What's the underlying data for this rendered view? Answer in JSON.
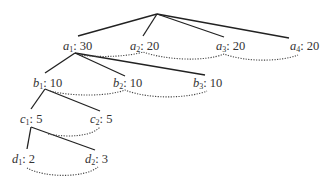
{
  "diagram": {
    "type": "tree",
    "root": {
      "x": 157,
      "y": 14
    },
    "nodes": [
      {
        "id": "a1",
        "letter": "a",
        "index": "1",
        "value": "30",
        "x": 63,
        "y": 40
      },
      {
        "id": "a2",
        "letter": "a",
        "index": "2",
        "value": "20",
        "x": 130,
        "y": 40
      },
      {
        "id": "a3",
        "letter": "a",
        "index": "3",
        "value": "20",
        "x": 216,
        "y": 40
      },
      {
        "id": "a4",
        "letter": "a",
        "index": "4",
        "value": "20",
        "x": 290,
        "y": 40
      },
      {
        "id": "b1",
        "letter": "b",
        "index": "1",
        "value": "10",
        "x": 33,
        "y": 77
      },
      {
        "id": "b2",
        "letter": "b",
        "index": "2",
        "value": "10",
        "x": 113,
        "y": 77
      },
      {
        "id": "b3",
        "letter": "b",
        "index": "3",
        "value": "10",
        "x": 193,
        "y": 77
      },
      {
        "id": "c1",
        "letter": "c",
        "index": "1",
        "value": "5",
        "x": 20,
        "y": 113
      },
      {
        "id": "c2",
        "letter": "c",
        "index": "2",
        "value": "5",
        "x": 90,
        "y": 113
      },
      {
        "id": "d1",
        "letter": "d",
        "index": "1",
        "value": "2",
        "x": 12,
        "y": 153
      },
      {
        "id": "d2",
        "letter": "d",
        "index": "2",
        "value": "3",
        "x": 85,
        "y": 153
      }
    ],
    "labels": {
      "a1": "a",
      "a1_sub": "1",
      "a1_val": ": 30",
      "a2": "a",
      "a2_sub": "2",
      "a2_val": ": 20",
      "a3": "a",
      "a3_sub": "3",
      "a3_val": ": 20",
      "a4": "a",
      "a4_sub": "4",
      "a4_val": ": 20",
      "b1": "b",
      "b1_sub": "1",
      "b1_val": ": 10",
      "b2": "b",
      "b2_sub": "2",
      "b2_val": ": 10",
      "b3": "b",
      "b3_sub": "3",
      "b3_val": ": 10",
      "c1": "c",
      "c1_sub": "1",
      "c1_val": ": 5",
      "c2": "c",
      "c2_sub": "2",
      "c2_val": ": 5",
      "d1": "d",
      "d1_sub": "1",
      "d1_val": ": 2",
      "d2": "d",
      "d2_sub": "2",
      "d2_val": ": 3"
    },
    "edges": [
      [
        "root",
        "a1"
      ],
      [
        "root",
        "a2"
      ],
      [
        "root",
        "a3"
      ],
      [
        "root",
        "a4"
      ],
      [
        "a1",
        "b1"
      ],
      [
        "a1",
        "b2"
      ],
      [
        "a1",
        "b3"
      ],
      [
        "b1",
        "c1"
      ],
      [
        "b1",
        "c2"
      ],
      [
        "c1",
        "d1"
      ],
      [
        "c1",
        "d2"
      ]
    ],
    "sibling_links_dotted": [
      [
        "a1",
        "a2",
        "a3",
        "a4"
      ],
      [
        "b1",
        "b2",
        "b3"
      ],
      [
        "c1",
        "c2"
      ],
      [
        "d1",
        "d2"
      ]
    ],
    "colors": {
      "edge": "#222222",
      "link": "#444444",
      "text": "#333333"
    }
  }
}
